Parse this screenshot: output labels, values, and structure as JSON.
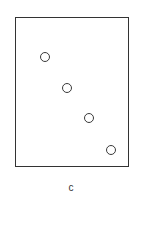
{
  "diagram": {
    "label": "c",
    "frame": {
      "x": 15,
      "y": 17,
      "width": 114,
      "height": 150,
      "stroke": "#333333"
    },
    "circles": [
      {
        "cx": 45,
        "cy": 57,
        "r": 5
      },
      {
        "cx": 67,
        "cy": 88,
        "r": 5
      },
      {
        "cx": 89,
        "cy": 118,
        "r": 5
      },
      {
        "cx": 111,
        "cy": 150,
        "r": 5
      }
    ]
  }
}
